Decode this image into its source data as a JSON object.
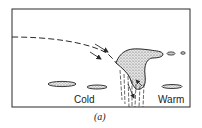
{
  "figure": {
    "labels": {
      "cold": "Cold",
      "warm": "Warm"
    },
    "caption": "(a)",
    "colors": {
      "ink": "#2a2a2a",
      "cloud_fill": "#c8c8c8",
      "background": "#ffffff"
    },
    "elements": [
      "frame",
      "dashed-airflow-trajectory",
      "flow-arrows",
      "cumulonimbus-cloud",
      "precipitation-streaks",
      "lenticular-clouds",
      "dashed-anvil-extension"
    ]
  }
}
